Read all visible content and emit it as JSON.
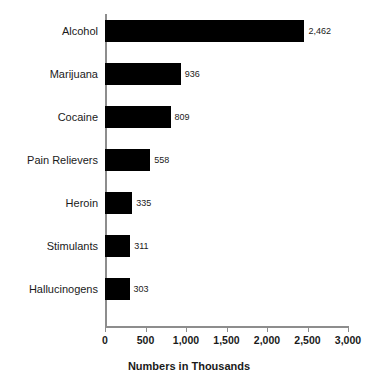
{
  "chart_data": {
    "type": "bar",
    "orientation": "horizontal",
    "title": "",
    "xlabel": "Numbers in Thousands",
    "ylabel": "",
    "categories": [
      "Alcohol",
      "Marijuana",
      "Cocaine",
      "Pain Relievers",
      "Heroin",
      "Stimulants",
      "Hallucinogens"
    ],
    "values": [
      2462,
      936,
      809,
      558,
      335,
      311,
      303
    ],
    "value_labels": [
      "2,462",
      "936",
      "809",
      "558",
      "335",
      "311",
      "303"
    ],
    "xlim": [
      0,
      3000
    ],
    "xticks": [
      0,
      500,
      1000,
      1500,
      2000,
      2500,
      3000
    ],
    "xtick_labels": [
      "0",
      "500",
      "1,000",
      "1,500",
      "2,000",
      "2,500",
      "3,000"
    ],
    "grid": false,
    "legend": false,
    "bar_color": "#000000",
    "axis_color": "#8d8d8d",
    "text_color": "#1a1a1a"
  }
}
